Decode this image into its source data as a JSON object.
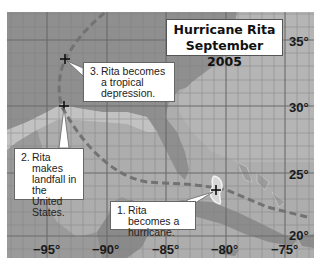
{
  "map": {
    "title_line1": "Hurricane Rita",
    "title_line2": "September 2005",
    "latitude_labels": [
      "35°",
      "30°",
      "25°",
      "20°"
    ],
    "longitude_labels": [
      "−95°",
      "−90°",
      "−85°",
      "−80°",
      "−75°"
    ],
    "callouts": [
      {
        "number": "1.",
        "text": "Rita becomes a hurricane."
      },
      {
        "number": "2.",
        "text": "Rita makes landfall in the United States."
      },
      {
        "number": "3.",
        "text": "Rita becomes a tropical depression."
      }
    ],
    "colors": {
      "water": "#a9a9a9",
      "land_dark": "#8c8c8c",
      "land_light": "#c4c4c4",
      "track": "#6e6e6e",
      "grid": "#7a7a7a"
    }
  }
}
